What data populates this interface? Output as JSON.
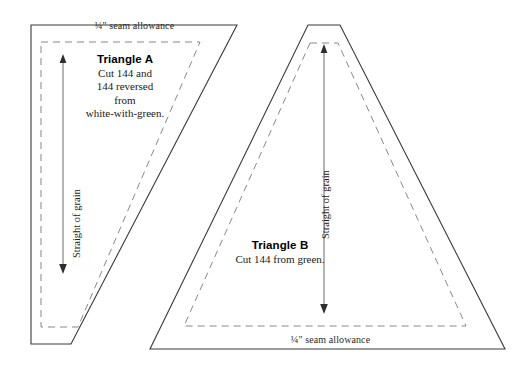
{
  "figure": {
    "kind": "quilt-template-diagram",
    "background_color": "#ffffff",
    "outline_color": "#3a3a3a",
    "seam_line_color": "#888888",
    "grain_arrow_color": "#6a6a6a"
  },
  "templates": [
    {
      "id": "triangle-a",
      "title": "Triangle A",
      "instruction_lines": [
        "Cut 144 and",
        "144 reversed",
        "from",
        "white-with-green."
      ],
      "seam_allowance_label": "¼\" seam allowance",
      "seam_allowance_position": "top",
      "grain_label": "Straight of grain",
      "shape": "right-triangle",
      "outline_points": "31,25 237,25 71,344 31,344",
      "seam_points": "41,42 200,42 78,327 41,327"
    },
    {
      "id": "triangle-b",
      "title": "Triangle B",
      "instruction_lines": [
        "Cut 144 from green."
      ],
      "seam_allowance_label": "¼\" seam allowance",
      "seam_allowance_position": "bottom",
      "grain_label": "Straight of grain",
      "shape": "isosceles-triangle-flat-apex",
      "outline_points": "308,25 340,25 505,349 150,349",
      "seam_points": "310,43 338,43 466,326 184,326"
    }
  ],
  "grain_arrows": [
    {
      "id": "grain-arrow-a",
      "direction": "down",
      "x": 63,
      "y_top": 57,
      "y_bottom": 272
    },
    {
      "id": "grain-arrow-b",
      "direction": "down",
      "x": 324,
      "y_top": 47,
      "y_bottom": 312
    }
  ]
}
